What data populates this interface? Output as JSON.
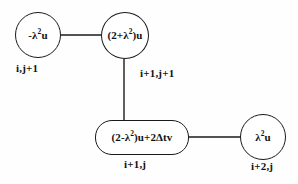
{
  "diagram": {
    "background_color": "#fefefe",
    "stroke_color": "#1a1a1a",
    "nodes": [
      {
        "id": "node-1",
        "shape": "circle",
        "expression": "-λ²u",
        "expr_base": "-λ",
        "expr_sup": "2",
        "expr_tail": "u",
        "index_label": "i,j+1"
      },
      {
        "id": "node-2",
        "shape": "circle",
        "expression": "(2+λ²)u",
        "expr_base": "(2+λ",
        "expr_sup": "2",
        "expr_tail": ")u",
        "index_label": "i+1,j+1"
      },
      {
        "id": "node-3",
        "shape": "stadium",
        "expression": "(2-λ²)u+2Δtv",
        "expr_base": "(2-λ",
        "expr_sup": "2",
        "expr_tail": ")u+2Δtv",
        "index_label": "i+1,j"
      },
      {
        "id": "node-4",
        "shape": "circle",
        "expression": "λ²u",
        "expr_base": "λ",
        "expr_sup": "2",
        "expr_tail": "u",
        "index_label": "i+2,j"
      }
    ],
    "edges": [
      {
        "id": "edge-1-2",
        "from": "node-1",
        "to": "node-2",
        "orientation": "horizontal"
      },
      {
        "id": "edge-2-3",
        "from": "node-2",
        "to": "node-3",
        "orientation": "vertical"
      },
      {
        "id": "edge-3-4",
        "from": "node-3",
        "to": "node-4",
        "orientation": "horizontal"
      }
    ]
  }
}
